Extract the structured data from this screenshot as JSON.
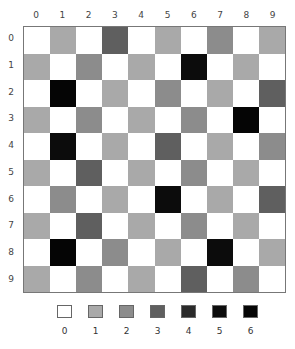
{
  "chart_data": {
    "type": "heatmap",
    "title": "",
    "xlabel": "",
    "ylabel": "",
    "x_ticks": [
      "0",
      "1",
      "2",
      "3",
      "4",
      "5",
      "6",
      "7",
      "8",
      "9"
    ],
    "y_ticks": [
      "0",
      "1",
      "2",
      "3",
      "4",
      "5",
      "6",
      "7",
      "8",
      "9"
    ],
    "legend": {
      "position": "bottom",
      "levels": [
        "0",
        "1",
        "2",
        "3",
        "4",
        "5",
        "6"
      ],
      "colors": [
        "#ffffff",
        "#a9a9a9",
        "#8c8c8c",
        "#5f5f5f",
        "#2a2a2a",
        "#0c0c0c",
        "#050505"
      ]
    },
    "values": [
      [
        0,
        1,
        0,
        3,
        0,
        1,
        0,
        2,
        0,
        1
      ],
      [
        1,
        0,
        2,
        0,
        1,
        0,
        5,
        0,
        1,
        0
      ],
      [
        0,
        6,
        0,
        1,
        0,
        2,
        0,
        1,
        0,
        3
      ],
      [
        1,
        0,
        2,
        0,
        1,
        0,
        2,
        0,
        6,
        0
      ],
      [
        0,
        5,
        0,
        1,
        0,
        3,
        0,
        1,
        0,
        2
      ],
      [
        1,
        0,
        3,
        0,
        1,
        0,
        2,
        0,
        1,
        0
      ],
      [
        0,
        2,
        0,
        1,
        0,
        5,
        0,
        1,
        0,
        3
      ],
      [
        1,
        0,
        3,
        0,
        1,
        0,
        2,
        0,
        1,
        0
      ],
      [
        0,
        6,
        0,
        2,
        0,
        1,
        0,
        5,
        0,
        1
      ],
      [
        1,
        0,
        2,
        0,
        1,
        0,
        3,
        0,
        2,
        0
      ]
    ]
  }
}
